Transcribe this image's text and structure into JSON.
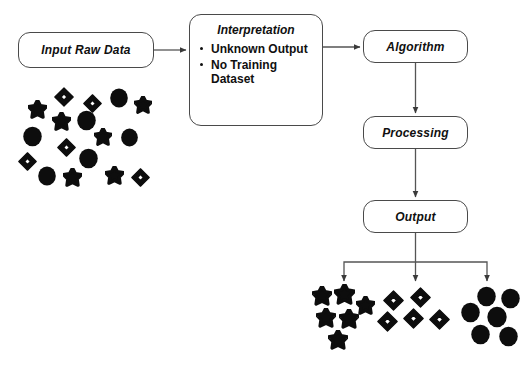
{
  "diagram": {
    "background_color": "#ffffff",
    "stroke_color": "#4a4a4a",
    "glyph_color": "#0d0d0d"
  },
  "nodes": {
    "input": {
      "label": "Input Raw Data",
      "x": 18,
      "y": 32,
      "w": 136,
      "h": 36
    },
    "interpretation": {
      "label": "Interpretation",
      "x": 189,
      "y": 14,
      "w": 134,
      "h": 112
    },
    "algorithm": {
      "label": "Algorithm",
      "x": 363,
      "y": 30,
      "w": 105,
      "h": 33
    },
    "processing": {
      "label": "Processing",
      "x": 363,
      "y": 116,
      "w": 105,
      "h": 33
    },
    "output": {
      "label": "Output",
      "x": 363,
      "y": 200,
      "w": 105,
      "h": 33
    }
  },
  "interpretation_bullets": [
    "Unknown Output",
    "No Training Dataset"
  ],
  "clusters": {
    "raw_mixed": {
      "name": "mixed-raw-data",
      "x": 10,
      "y": 82,
      "w": 150,
      "h": 90,
      "shapes": [
        {
          "type": "star",
          "x": 18,
          "y": 18,
          "size": 19
        },
        {
          "type": "diamond",
          "x": 44,
          "y": 5,
          "size": 20
        },
        {
          "type": "diamond",
          "x": 73,
          "y": 12,
          "size": 19
        },
        {
          "type": "circle",
          "x": 99,
          "y": 6,
          "size": 20
        },
        {
          "type": "star",
          "x": 124,
          "y": 14,
          "size": 18
        },
        {
          "type": "star",
          "x": 42,
          "y": 30,
          "size": 19
        },
        {
          "type": "circle",
          "x": 66,
          "y": 28,
          "size": 21
        },
        {
          "type": "circle",
          "x": 12,
          "y": 44,
          "size": 21
        },
        {
          "type": "star",
          "x": 84,
          "y": 46,
          "size": 18
        },
        {
          "type": "circle",
          "x": 110,
          "y": 46,
          "size": 19
        },
        {
          "type": "diamond",
          "x": 47,
          "y": 56,
          "size": 19
        },
        {
          "type": "diamond",
          "x": 8,
          "y": 70,
          "size": 19
        },
        {
          "type": "circle",
          "x": 68,
          "y": 66,
          "size": 21
        },
        {
          "type": "circle",
          "x": 27,
          "y": 84,
          "size": 20
        },
        {
          "type": "star",
          "x": 53,
          "y": 86,
          "size": 19
        },
        {
          "type": "star",
          "x": 95,
          "y": 84,
          "size": 19
        },
        {
          "type": "diamond",
          "x": 121,
          "y": 86,
          "size": 19
        }
      ]
    },
    "stars": {
      "name": "star-cluster",
      "x": 306,
      "y": 284,
      "w": 72,
      "h": 66,
      "shapes": [
        {
          "type": "star",
          "x": 6,
          "y": 2,
          "size": 20
        },
        {
          "type": "star",
          "x": 28,
          "y": 0,
          "size": 21
        },
        {
          "type": "star",
          "x": 50,
          "y": 12,
          "size": 19
        },
        {
          "type": "star",
          "x": 10,
          "y": 24,
          "size": 20
        },
        {
          "type": "star",
          "x": 33,
          "y": 25,
          "size": 20
        },
        {
          "type": "star",
          "x": 22,
          "y": 46,
          "size": 20
        }
      ]
    },
    "diamonds": {
      "name": "diamond-cluster",
      "x": 377,
      "y": 290,
      "w": 76,
      "h": 48,
      "shapes": [
        {
          "type": "diamond",
          "x": 6,
          "y": 0,
          "size": 21
        },
        {
          "type": "diamond",
          "x": 33,
          "y": -3,
          "size": 21
        },
        {
          "type": "diamond",
          "x": 0,
          "y": 21,
          "size": 21
        },
        {
          "type": "diamond",
          "x": 26,
          "y": 18,
          "size": 21
        },
        {
          "type": "diamond",
          "x": 52,
          "y": 19,
          "size": 21
        }
      ]
    },
    "circles": {
      "name": "circle-cluster",
      "x": 458,
      "y": 286,
      "w": 64,
      "h": 62,
      "shapes": [
        {
          "type": "circle",
          "x": 18,
          "y": 0,
          "size": 21
        },
        {
          "type": "circle",
          "x": 42,
          "y": 2,
          "size": 21
        },
        {
          "type": "circle",
          "x": 2,
          "y": 16,
          "size": 21
        },
        {
          "type": "circle",
          "x": 28,
          "y": 20,
          "size": 22
        },
        {
          "type": "circle",
          "x": 12,
          "y": 38,
          "size": 21
        },
        {
          "type": "circle",
          "x": 40,
          "y": 40,
          "size": 21
        }
      ]
    }
  },
  "connectors": [
    {
      "name": "input-to-interpretation",
      "from": "input",
      "to": "interpretation"
    },
    {
      "name": "interpretation-to-algorithm",
      "from": "interpretation",
      "to": "algorithm"
    },
    {
      "name": "algorithm-to-processing",
      "from": "algorithm",
      "to": "processing"
    },
    {
      "name": "processing-to-output",
      "from": "processing",
      "to": "output"
    },
    {
      "name": "output-to-stars",
      "from": "output",
      "to": "stars"
    },
    {
      "name": "output-to-diamonds",
      "from": "output",
      "to": "diamonds"
    },
    {
      "name": "output-to-circles",
      "from": "output",
      "to": "circles"
    }
  ]
}
